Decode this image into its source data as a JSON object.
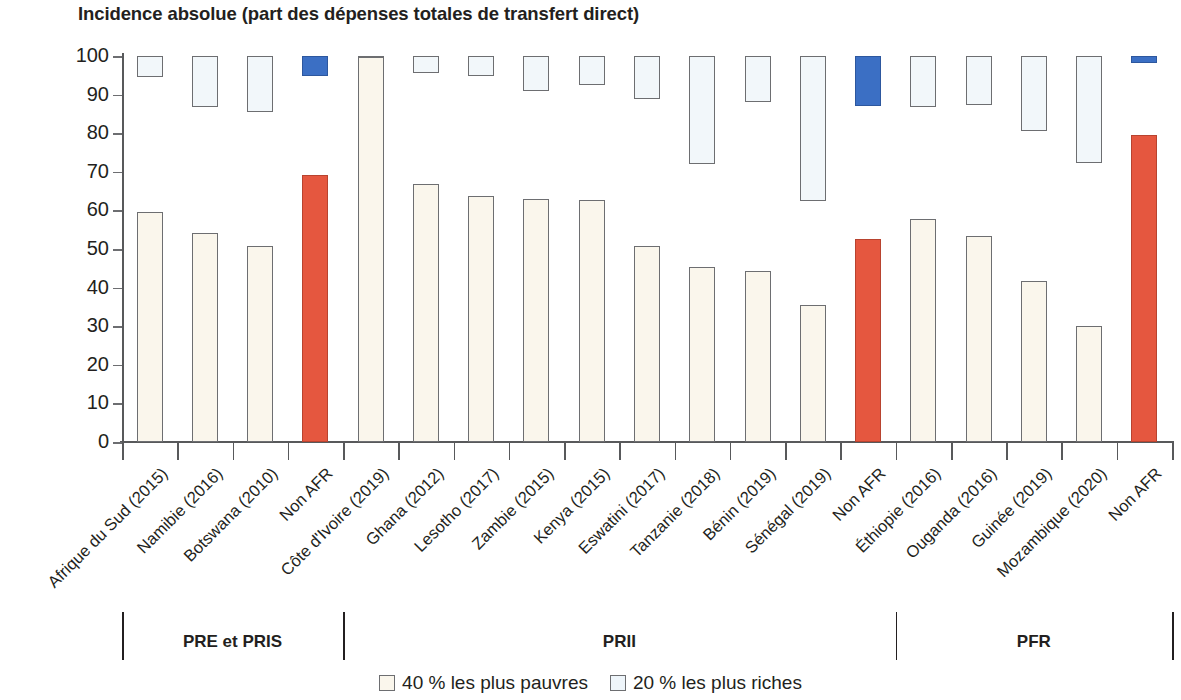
{
  "chart_data": {
    "type": "bar",
    "title": "Incidence absolue (part des dépenses totales de transfert direct)",
    "xlabel": "",
    "ylabel": "",
    "ylim": [
      0,
      100
    ],
    "yticks": [
      0,
      10,
      20,
      30,
      40,
      50,
      60,
      70,
      80,
      90,
      100
    ],
    "grid": false,
    "legend_position": "bottom",
    "legend": [
      "40 % les plus pauvres",
      "20 % les plus riches"
    ],
    "colors": {
      "poor": "#faf6ec",
      "rich": "#f2f7fa",
      "poor_highlight": "#e5573f",
      "rich_highlight": "#3b6fc4",
      "stroke": "#6d6e71",
      "axis": "#58595b"
    },
    "categories": [
      "Afrique du Sud (2015)",
      "Namibie (2016)",
      "Botswana (2010)",
      "Non AFR",
      "Côte d'Ivoire (2019)",
      "Ghana (2012)",
      "Lesotho (2017)",
      "Zambie (2015)",
      "Kenya (2015)",
      "Eswatini (2017)",
      "Tanzanie (2018)",
      "Bénin (2019)",
      "Sénégal (2019)",
      "Non AFR",
      "Éthiopie (2016)",
      "Ouganda (2016)",
      "Guinée (2019)",
      "Mozambique (2020)",
      "Non AFR"
    ],
    "series": [
      {
        "name": "40 % les plus pauvres",
        "note": "bars start at 0",
        "values": [
          59.5,
          54.2,
          50.8,
          69.3,
          99.8,
          66.8,
          63.8,
          63.0,
          62.8,
          50.7,
          45.3,
          44.2,
          35.4,
          52.7,
          57.8,
          53.3,
          41.8,
          30.0,
          79.6
        ]
      },
      {
        "name": "20 % les plus riches",
        "note": "floating range bars (top, bottom)",
        "tops": [
          100,
          100,
          100,
          100,
          100,
          100,
          100,
          100,
          100,
          100,
          100,
          100,
          100,
          100,
          100,
          100,
          100,
          100,
          100
        ],
        "bottoms": [
          94.5,
          86.8,
          85.5,
          94.8,
          100,
          95.5,
          94.7,
          91.0,
          92.6,
          88.8,
          72.0,
          88.0,
          62.5,
          87.0,
          86.8,
          87.2,
          80.5,
          72.4,
          98.2
        ]
      }
    ],
    "highlighted_category": "Non AFR",
    "groups": [
      {
        "label": "PRE et PRIS",
        "start": 0,
        "end": 3
      },
      {
        "label": "PRII",
        "start": 4,
        "end": 13
      },
      {
        "label": "PFR",
        "start": 14,
        "end": 18
      }
    ]
  }
}
